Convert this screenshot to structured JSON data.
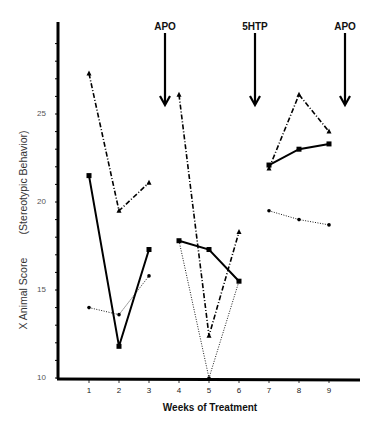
{
  "chart_data": {
    "type": "line",
    "title": "",
    "xlabel": "Weeks of Treatment",
    "ylabel": "X Animal Score (Stereotypic Behavior)",
    "ylabel_parts": {
      "main": "X Animal Score",
      "sub": "(Stereotypic Behavior)"
    },
    "x": [
      1,
      2,
      3,
      4,
      5,
      6,
      7,
      8,
      9
    ],
    "x_tick_labels": [
      "1",
      "2",
      "3",
      "4",
      "5",
      "6",
      "7",
      "8",
      "9"
    ],
    "y_tick_labels": [
      "10",
      "15",
      "20",
      "25"
    ],
    "ylim": [
      10,
      30
    ],
    "xlim": [
      0,
      10
    ],
    "grid": false,
    "legend": "none",
    "segments": [
      [
        1,
        2,
        3
      ],
      [
        4,
        5,
        6
      ],
      [
        7,
        8,
        9
      ]
    ],
    "series": [
      {
        "name": "Solid line, square markers",
        "style": "solid",
        "marker": "square",
        "values": [
          21.5,
          11.8,
          17.3,
          17.8,
          17.3,
          15.5,
          22.1,
          23.0,
          23.3
        ]
      },
      {
        "name": "Dash-dot line, triangle markers",
        "style": "dashdot",
        "marker": "triangle",
        "values": [
          27.3,
          19.5,
          21.1,
          26.1,
          12.4,
          18.3,
          21.9,
          26.1,
          24.0
        ]
      },
      {
        "name": "Dotted line, circle markers",
        "style": "dotted",
        "marker": "circle",
        "values": [
          14.0,
          13.6,
          15.8,
          17.8,
          10.0,
          15.5,
          19.5,
          19.0,
          18.7
        ]
      }
    ],
    "annotations": [
      {
        "label": "APO",
        "x": 3.5,
        "type": "down-arrow"
      },
      {
        "label": "5HTP",
        "x": 6.5,
        "type": "down-arrow"
      },
      {
        "label": "APO",
        "x": 9.5,
        "type": "down-arrow"
      }
    ]
  }
}
